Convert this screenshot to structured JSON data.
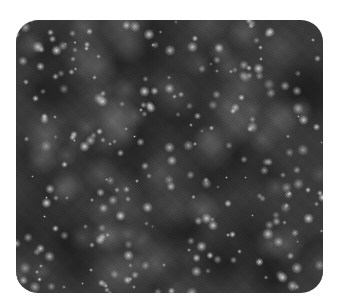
{
  "image": {
    "description": "grayscale speckle / starfield noise texture in a rounded rectangle",
    "panel": {
      "left": 16,
      "top": 20,
      "width": 307,
      "height": 273,
      "corner_radius": 22
    },
    "colors": {
      "page_background": "#ffffff",
      "base": "#3a3a3a",
      "dark_patch": "#1e1e1e",
      "mid_cloud": "#6a6a6a",
      "highlight": "#d8d8d8"
    },
    "texture": {
      "seed": 1337,
      "dark_patches": 45,
      "clouds": 70,
      "speckles": 260
    }
  }
}
